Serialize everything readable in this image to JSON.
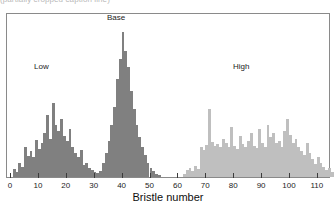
{
  "figure": {
    "caption_sliver": "(partially cropped caption line)",
    "background_color": "#ffffff",
    "frame_color": "#8a8a8a"
  },
  "annotations": {
    "low_label": "Low",
    "base_label": "Base",
    "high_label": "High"
  },
  "axis": {
    "x_title": "Bristle number",
    "tick_labels": [
      "0",
      "10",
      "20",
      "30",
      "40",
      "50",
      "60",
      "70",
      "80",
      "90",
      "100",
      "110"
    ]
  },
  "chart_data": {
    "type": "bar",
    "title": "",
    "subtitle": "",
    "xlabel": "Bristle number",
    "ylabel": "",
    "xlim": [
      -1,
      117
    ],
    "ylim": [
      0,
      163
    ],
    "grid": false,
    "legend": null,
    "bin_width": 1,
    "colors": {
      "low": "#808080",
      "base": "#808080",
      "high": "#bfbfbf"
    },
    "annotations": [
      {
        "text": "Low",
        "x": 11,
        "y": 101
      },
      {
        "text": "Base",
        "x": 38,
        "y": 152
      },
      {
        "text": "High",
        "x": 83,
        "y": 101
      },
      {
        "text": "Bristle number",
        "x": 58,
        "y": -22
      }
    ],
    "series": [
      {
        "name": "Low",
        "color": "#808080",
        "x": [
          1,
          2,
          3,
          4,
          5,
          6,
          7,
          8,
          9,
          10,
          11,
          12,
          13,
          14,
          15,
          16,
          17,
          18,
          19,
          20,
          21,
          22,
          23,
          24,
          25,
          26,
          27,
          28,
          29,
          30,
          31,
          32,
          33,
          34,
          35,
          36,
          37,
          38,
          39,
          40,
          41,
          42,
          43,
          44,
          45,
          46,
          47,
          48,
          49,
          50,
          51,
          52,
          53
        ],
        "values": [
          8,
          5,
          14,
          10,
          30,
          21,
          26,
          20,
          37,
          28,
          34,
          44,
          62,
          38,
          74,
          52,
          46,
          58,
          41,
          36,
          48,
          30,
          24,
          20,
          27,
          12,
          14,
          9,
          7,
          5,
          4,
          3,
          2,
          3,
          2,
          2,
          2,
          2,
          2,
          2,
          2,
          2,
          2,
          2,
          2,
          2,
          2,
          2,
          2,
          2,
          2,
          2,
          2
        ]
      },
      {
        "name": "Base",
        "color": "#808080",
        "x": [
          30,
          31,
          32,
          33,
          34,
          35,
          36,
          37,
          38,
          39,
          40,
          41,
          42,
          43,
          44,
          45,
          46,
          47,
          48,
          49,
          50,
          51,
          52,
          53
        ],
        "values": [
          2,
          3,
          6,
          14,
          24,
          36,
          52,
          70,
          98,
          118,
          145,
          126,
          110,
          86,
          68,
          52,
          40,
          30,
          22,
          14,
          9,
          6,
          3,
          2
        ]
      },
      {
        "name": "High",
        "color": "#bfbfbf",
        "x": [
          62,
          63,
          64,
          65,
          66,
          67,
          68,
          69,
          70,
          71,
          72,
          73,
          74,
          75,
          76,
          77,
          78,
          79,
          80,
          81,
          82,
          83,
          84,
          85,
          86,
          87,
          88,
          89,
          90,
          91,
          92,
          93,
          94,
          95,
          96,
          97,
          98,
          99,
          100,
          101,
          102,
          103,
          104,
          105,
          106,
          107,
          108,
          109,
          110,
          111,
          112,
          113,
          114,
          115
        ],
        "values": [
          3,
          7,
          9,
          6,
          11,
          8,
          30,
          27,
          32,
          68,
          35,
          31,
          33,
          30,
          38,
          34,
          30,
          50,
          31,
          28,
          41,
          33,
          30,
          36,
          44,
          31,
          29,
          48,
          34,
          30,
          52,
          40,
          44,
          34,
          36,
          30,
          46,
          58,
          42,
          34,
          38,
          30,
          26,
          22,
          34,
          24,
          18,
          13,
          20,
          14,
          10,
          7,
          9,
          5
        ]
      }
    ]
  }
}
